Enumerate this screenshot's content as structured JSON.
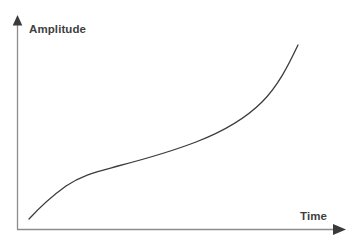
{
  "figure": {
    "background_color": "#ffffff",
    "width": 359,
    "height": 244
  },
  "axes": {
    "y_label": "Amplitude",
    "x_label": "Time",
    "label_color": "#3f3f3f",
    "axis_color": "#8c8c8c",
    "arrow_color": "#3a3a3a",
    "y_axis_x": 17,
    "y_axis_top": 16,
    "x_axis_y": 229,
    "x_axis_end": 345
  },
  "curve": {
    "color": "#3c3c3c",
    "width": 1.3,
    "path": "M29,219 C41,206 52,196 66,186 C82,175 96,172 118,166 C145,159 170,152 196,142 C222,132 244,120 262,102 C278,86 288,66 298,45"
  },
  "icons": {
    "y_arrow": "arrow-up-icon",
    "x_arrow": "arrow-right-icon"
  },
  "chart_data": {
    "type": "line",
    "title": "",
    "xlabel": "Time",
    "ylabel": "Amplitude",
    "legend": [],
    "grid": false,
    "xlim": [
      0,
      1
    ],
    "ylim": [
      0,
      1
    ],
    "x_ticks": [],
    "y_ticks": [],
    "series": [
      {
        "name": "Amplitude vs Time",
        "x": [
          0.0,
          0.05,
          0.1,
          0.15,
          0.2,
          0.25,
          0.3,
          0.35,
          0.4,
          0.45,
          0.5,
          0.55,
          0.6,
          0.65,
          0.7,
          0.75,
          0.8,
          0.85,
          0.9,
          0.95,
          1.0
        ],
        "y": [
          0.0,
          0.12,
          0.2,
          0.25,
          0.28,
          0.31,
          0.33,
          0.35,
          0.37,
          0.39,
          0.41,
          0.44,
          0.47,
          0.51,
          0.56,
          0.62,
          0.69,
          0.77,
          0.85,
          0.93,
          1.0
        ]
      }
    ]
  }
}
